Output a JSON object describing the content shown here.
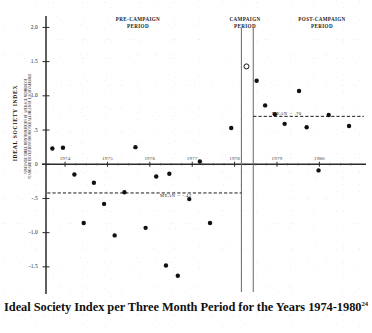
{
  "caption": {
    "text": "Ideal Society Index per Three Month Period for the Years 1974-1980",
    "footnote_marker": "24"
  },
  "axis": {
    "y_title": "IDEAL SOCIETY INDEX",
    "y_subtitle": "SUM OVER THREE MONTH PERIODS OF AVERAGE NUMBER OF\nSTANDARD DEVIATIONS FROM OVERALL MEAN OF EACH VARIABLE"
  },
  "bands": {
    "pre": "PRE-CAMPAIGN\nPERIOD",
    "campaign": "CAMPAIGN\nPERIOD",
    "post": "POST-CAMPAIGN\nPERIOD"
  },
  "annotations": {
    "mean_pre_label": "MEAN = -.42",
    "mean_post_label": "MEAN = .70"
  },
  "chart_data": {
    "type": "scatter",
    "title": "Ideal Society Index per Three Month Period for the Years 1974-1980",
    "xlabel": "",
    "ylabel": "IDEAL SOCIETY INDEX",
    "ylabel_full": "SUM OVER THREE MONTH PERIODS OF AVERAGE NUMBER OF STANDARD DEVIATIONS FROM OVERALL MEAN OF EACH VARIABLE",
    "xlim": [
      1973.55,
      1981.1
    ],
    "ylim": [
      -1.78,
      2.05
    ],
    "grid": false,
    "legend": false,
    "yticks": [
      2.0,
      1.5,
      1.0,
      0.5,
      0.0,
      -0.5,
      -1.0,
      -1.5
    ],
    "ytick_labels": [
      "2.0",
      "1.5",
      "1.0",
      ".5",
      "0",
      "-.5",
      "-1.0",
      "-1.5"
    ],
    "xticks": [
      1974,
      1975,
      1976,
      1977,
      1978,
      1979,
      1980
    ],
    "xtick_labels": [
      "1974",
      "1975",
      "1976",
      "1977",
      "1978",
      "1979",
      "1980"
    ],
    "series": [
      {
        "name": "Ideal Society Index",
        "marker": "filled-circle",
        "color": "#111111",
        "points": [
          {
            "x": 1973.7,
            "y": 0.23
          },
          {
            "x": 1973.95,
            "y": 0.24
          },
          {
            "x": 1974.22,
            "y": -0.15
          },
          {
            "x": 1974.44,
            "y": -0.86
          },
          {
            "x": 1974.68,
            "y": -0.27
          },
          {
            "x": 1974.92,
            "y": -0.58
          },
          {
            "x": 1975.17,
            "y": -1.04
          },
          {
            "x": 1975.4,
            "y": -0.41
          },
          {
            "x": 1975.66,
            "y": 0.25
          },
          {
            "x": 1975.9,
            "y": -0.93
          },
          {
            "x": 1976.15,
            "y": -0.18
          },
          {
            "x": 1976.38,
            "y": -1.48
          },
          {
            "x": 1976.46,
            "y": -0.14
          },
          {
            "x": 1976.66,
            "y": -1.63
          },
          {
            "x": 1976.93,
            "y": -0.51
          },
          {
            "x": 1977.18,
            "y": 0.04
          },
          {
            "x": 1977.42,
            "y": -0.86
          },
          {
            "x": 1977.92,
            "y": 0.53
          },
          {
            "x": 1978.52,
            "y": 1.22
          },
          {
            "x": 1978.72,
            "y": 0.86
          },
          {
            "x": 1978.95,
            "y": 0.73
          },
          {
            "x": 1979.18,
            "y": 0.59
          },
          {
            "x": 1979.52,
            "y": 1.07
          },
          {
            "x": 1979.7,
            "y": 0.54
          },
          {
            "x": 1979.98,
            "y": -0.09
          },
          {
            "x": 1980.22,
            "y": 0.72
          },
          {
            "x": 1980.7,
            "y": 0.56
          }
        ]
      },
      {
        "name": "Campaign period outlier",
        "marker": "open-circle",
        "color": "#111111",
        "points": [
          {
            "x": 1978.28,
            "y": 1.43
          }
        ]
      }
    ],
    "mean_lines": [
      {
        "label": "MEAN = -.42",
        "value": -0.42,
        "x_start": 1973.58,
        "x_end": 1978.16,
        "style": "dashed"
      },
      {
        "label": "MEAN = .70",
        "value": 0.7,
        "x_start": 1978.44,
        "x_end": 1981.05,
        "style": "dashed"
      }
    ],
    "dividers": [
      {
        "x": 1978.16,
        "style": "solid"
      },
      {
        "x": 1978.44,
        "style": "solid"
      }
    ],
    "regions": [
      {
        "label": "PRE-CAMPAIGN PERIOD",
        "x_start": 1973.55,
        "x_end": 1978.16
      },
      {
        "label": "CAMPAIGN PERIOD",
        "x_start": 1978.16,
        "x_end": 1978.44
      },
      {
        "label": "POST-CAMPAIGN PERIOD",
        "x_start": 1978.44,
        "x_end": 1981.1
      }
    ]
  }
}
